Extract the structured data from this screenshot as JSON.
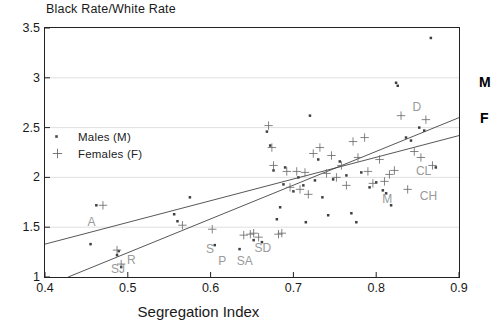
{
  "chart": {
    "type": "scatter",
    "title": "Black Rate/White Rate",
    "xlabel": "Segregation Index",
    "ylabel": "Black Rate/White Rate",
    "xlim": [
      0.4,
      0.9
    ],
    "ylim": [
      1,
      3.5
    ],
    "grid": true,
    "xticks": [
      "0.4",
      "0.5",
      "0.6",
      "0.7",
      "0.8",
      "0.9"
    ],
    "xtick_values": [
      0.4,
      0.5,
      0.6,
      0.7,
      0.8,
      0.9
    ],
    "yticks": [
      "1",
      "1.5",
      "2",
      "2.5",
      "3",
      "3.5"
    ],
    "ytick_values": [
      1,
      1.5,
      2,
      2.5,
      3,
      3.5
    ]
  },
  "legend": {
    "position": "inside-top-left",
    "entries": [
      {
        "marker": "male-dot-marker",
        "glyph": "·",
        "label": "Males (M)"
      },
      {
        "marker": "female-plus-marker",
        "glyph": "+",
        "label": "Females (F)"
      }
    ]
  },
  "line_labels": {
    "males": "M",
    "females": "F"
  },
  "chart_data": {
    "type": "scatter",
    "title": "Black Rate/White Rate",
    "xlabel": "Segregation Index",
    "ylabel": "Black Rate/White Rate",
    "xlim": [
      0.4,
      0.9
    ],
    "ylim": [
      1,
      3.5
    ],
    "grid": true,
    "legend_position": "inside-top-left",
    "series": [
      {
        "name": "Males (M)",
        "marker": "dot",
        "points": [
          [
            0.455,
            1.33
          ],
          [
            0.462,
            1.72
          ],
          [
            0.487,
            1.22
          ],
          [
            0.489,
            1.26
          ],
          [
            0.492,
            1.1
          ],
          [
            0.556,
            1.63
          ],
          [
            0.56,
            1.56
          ],
          [
            0.575,
            1.8
          ],
          [
            0.605,
            1.32
          ],
          [
            0.635,
            1.28
          ],
          [
            0.652,
            1.37
          ],
          [
            0.662,
            1.35
          ],
          [
            0.668,
            2.46
          ],
          [
            0.672,
            2.32
          ],
          [
            0.676,
            2.07
          ],
          [
            0.68,
            1.58
          ],
          [
            0.684,
            1.7
          ],
          [
            0.688,
            1.93
          ],
          [
            0.69,
            2.1
          ],
          [
            0.7,
            1.86
          ],
          [
            0.706,
            2.0
          ],
          [
            0.712,
            1.92
          ],
          [
            0.715,
            1.55
          ],
          [
            0.72,
            2.62
          ],
          [
            0.726,
            1.97
          ],
          [
            0.73,
            2.18
          ],
          [
            0.735,
            1.8
          ],
          [
            0.742,
            1.62
          ],
          [
            0.748,
            1.98
          ],
          [
            0.756,
            2.16
          ],
          [
            0.764,
            2.02
          ],
          [
            0.77,
            1.64
          ],
          [
            0.776,
            1.55
          ],
          [
            0.782,
            2.05
          ],
          [
            0.792,
            1.9
          ],
          [
            0.8,
            1.95
          ],
          [
            0.808,
            1.87
          ],
          [
            0.812,
            1.84
          ],
          [
            0.818,
            1.72
          ],
          [
            0.824,
            2.95
          ],
          [
            0.826,
            2.92
          ],
          [
            0.836,
            2.4
          ],
          [
            0.842,
            2.37
          ],
          [
            0.852,
            2.5
          ],
          [
            0.858,
            2.47
          ],
          [
            0.866,
            3.4
          ],
          [
            0.872,
            2.1
          ]
        ]
      },
      {
        "name": "Females (F)",
        "marker": "plus",
        "points": [
          [
            0.47,
            1.72
          ],
          [
            0.487,
            1.27
          ],
          [
            0.492,
            1.13
          ],
          [
            0.566,
            1.52
          ],
          [
            0.602,
            1.48
          ],
          [
            0.64,
            1.42
          ],
          [
            0.648,
            1.43
          ],
          [
            0.652,
            1.44
          ],
          [
            0.658,
            1.4
          ],
          [
            0.67,
            2.52
          ],
          [
            0.674,
            2.3
          ],
          [
            0.676,
            2.12
          ],
          [
            0.682,
            1.43
          ],
          [
            0.686,
            1.44
          ],
          [
            0.692,
            2.06
          ],
          [
            0.696,
            1.9
          ],
          [
            0.704,
            2.06
          ],
          [
            0.708,
            1.88
          ],
          [
            0.714,
            2.05
          ],
          [
            0.718,
            1.83
          ],
          [
            0.724,
            2.24
          ],
          [
            0.732,
            2.3
          ],
          [
            0.74,
            2.04
          ],
          [
            0.746,
            2.22
          ],
          [
            0.752,
            2.0
          ],
          [
            0.758,
            2.12
          ],
          [
            0.764,
            1.92
          ],
          [
            0.772,
            2.36
          ],
          [
            0.778,
            2.2
          ],
          [
            0.786,
            2.4
          ],
          [
            0.79,
            2.06
          ],
          [
            0.796,
            1.94
          ],
          [
            0.804,
            2.18
          ],
          [
            0.81,
            1.96
          ],
          [
            0.816,
            2.03
          ],
          [
            0.822,
            2.07
          ],
          [
            0.83,
            2.62
          ],
          [
            0.838,
            1.88
          ],
          [
            0.846,
            2.26
          ],
          [
            0.854,
            2.2
          ],
          [
            0.86,
            2.58
          ],
          [
            0.868,
            2.12
          ]
        ]
      }
    ],
    "fit_lines": [
      {
        "name": "M",
        "label": "M",
        "from": [
          0.428,
          1.0
        ],
        "to": [
          0.9,
          2.6
        ]
      },
      {
        "name": "F",
        "label": "F",
        "from": [
          0.4,
          1.33
        ],
        "to": [
          0.9,
          2.42
        ]
      }
    ],
    "annotations": [
      {
        "text": "A",
        "x": 0.455,
        "y": 1.56
      },
      {
        "text": "SJ",
        "x": 0.487,
        "y": 1.09
      },
      {
        "text": "R",
        "x": 0.503,
        "y": 1.18
      },
      {
        "text": "S",
        "x": 0.598,
        "y": 1.29
      },
      {
        "text": "P",
        "x": 0.613,
        "y": 1.17
      },
      {
        "text": "SD",
        "x": 0.662,
        "y": 1.3
      },
      {
        "text": "SA",
        "x": 0.64,
        "y": 1.17
      },
      {
        "text": "D",
        "x": 0.848,
        "y": 2.72
      },
      {
        "text": "CL",
        "x": 0.856,
        "y": 2.07
      },
      {
        "text": "CH",
        "x": 0.862,
        "y": 1.82
      },
      {
        "text": "M",
        "x": 0.812,
        "y": 1.79
      }
    ]
  },
  "colors": {
    "axis": "#222222",
    "grid": "#d8d8d8",
    "marker": "#3a3a3a",
    "line": "#444444",
    "annotation": "#9a9a9a",
    "text": "#1a1a1a"
  }
}
